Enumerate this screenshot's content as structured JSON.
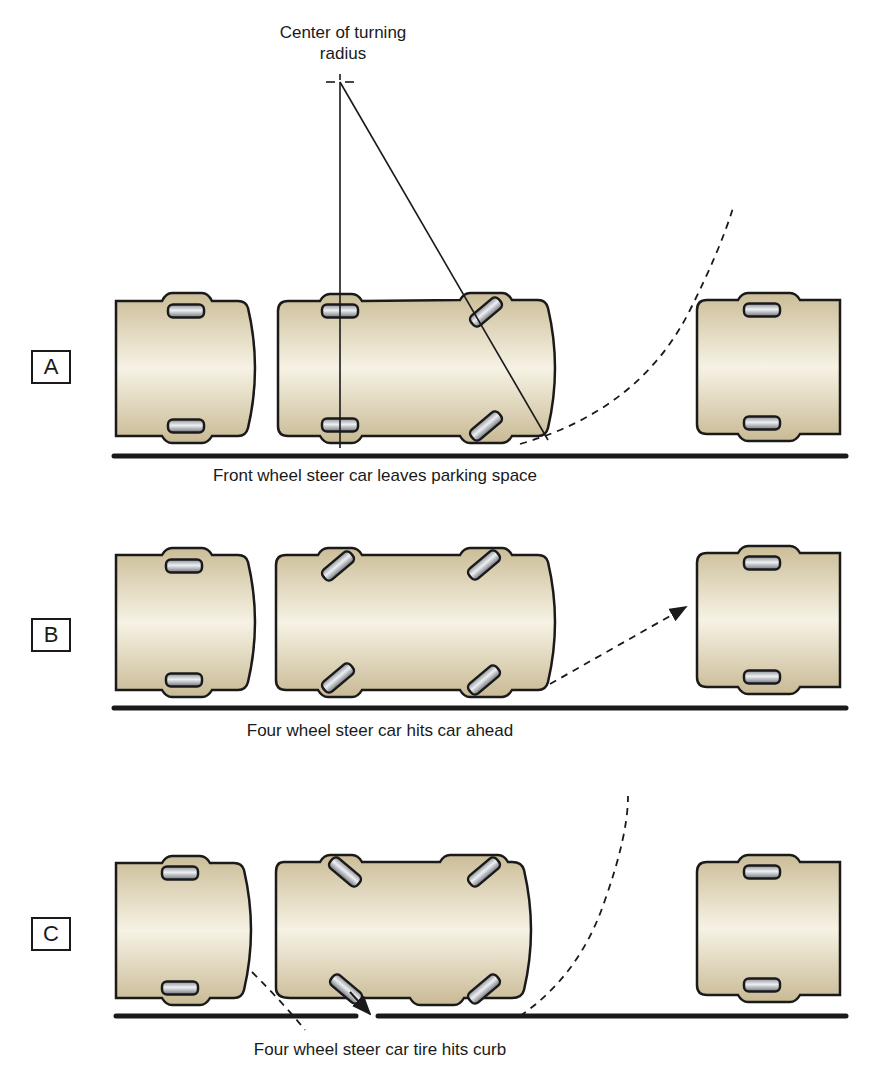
{
  "figure": {
    "center_label_line1": "Center of turning",
    "center_label_line2": "radius",
    "colors": {
      "car_body_dark": "#cdbf9c",
      "car_body_light": "#f4f0e2",
      "outline": "#1a1a1a",
      "tire_light": "#e8eaec",
      "tire_dark": "#7d8288",
      "curb": "#1a1a1a"
    }
  },
  "panels": [
    {
      "id": "A",
      "label": "A",
      "caption": "Front wheel steer car leaves parking space"
    },
    {
      "id": "B",
      "label": "B",
      "caption": "Four wheel steer car hits car ahead"
    },
    {
      "id": "C",
      "label": "C",
      "caption": "Four wheel steer car tire hits curb"
    }
  ]
}
